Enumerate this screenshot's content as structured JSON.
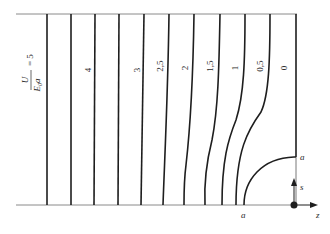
{
  "diagram": {
    "type": "equipotential-lines",
    "ratio_label": {
      "numerator": "U",
      "denominator_main": "E",
      "denominator_sub": "0",
      "denominator_tail": "a",
      "equals": "= 5"
    },
    "contour_labels": [
      "4",
      "3",
      "2,5",
      "2",
      "1,5",
      "1",
      "0,5",
      "0"
    ],
    "electrode_top_label": "a",
    "electrode_bottom_label": "a",
    "axis_s_label": "s",
    "axis_z_label": "z",
    "colors": {
      "line": "#1e1e1e",
      "boundary": "#8a8a8a",
      "text": "#2a2a2a"
    }
  }
}
